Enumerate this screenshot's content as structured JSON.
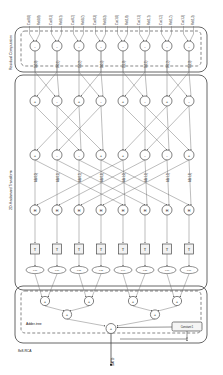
{
  "figure": {
    "bottom_block_label": "8x8-RCA",
    "output_label": "SATD"
  },
  "sections": {
    "residual": {
      "label": "Residual Computation"
    },
    "hadamard": {
      "label": "2D-Hadamard Transform"
    },
    "adder_tree": {
      "label": "Adder-tree"
    }
  },
  "constant": {
    "label": "Constant 1"
  },
  "top_inputs": [
    "Cur(0,0)",
    "Ref(0,0)",
    "Cur(0,1)",
    "Ref(0,1)",
    "Cur(0,2)",
    "Ref(0,2)",
    "Cur(0,3)",
    "Ref(0,3)",
    "Cur(1,0)",
    "Ref(1,0)",
    "Cur(1,1)",
    "Ref(1,1)",
    "Cur(1,2)",
    "Ref(1,2)",
    "Cur(1,3)",
    "Ref(1,3)"
  ],
  "residual_row": {
    "ops": [
      "-",
      "-",
      "-",
      "-",
      "-",
      "-",
      "-",
      "-"
    ],
    "outputs": [
      "D(0,0)",
      "D(0,1)",
      "D(0,2)",
      "D(0,3)",
      "D(1,0)",
      "D(1,1)",
      "D(1,2)",
      "D(1,3)"
    ]
  },
  "hadamard_stage1": {
    "ops": [
      "+",
      "-",
      "+",
      "-",
      "+",
      "-",
      "+",
      "-"
    ]
  },
  "hadamard_stage2": {
    "ops": [
      "+",
      "-",
      "-",
      "+",
      "+",
      "-",
      "-",
      "+"
    ],
    "outputs": [
      "AB(0,0)",
      "AB(0,1)",
      "AB(0,2)",
      "AB(0,3)",
      "AB(1,0)",
      "AB(1,1)",
      "AB(1,2)",
      "AB(1,3)"
    ]
  },
  "hadamard_stage3": {
    "ops": [
      "H",
      "H",
      "H",
      "H",
      "H",
      "H",
      "H",
      "H"
    ]
  },
  "abs_row": {
    "ops": [
      "T",
      "T",
      "T",
      "T",
      "T",
      "T",
      "T",
      "T"
    ],
    "labels": [
      "|H0|",
      "|H1|",
      "|H2|",
      "|H3|",
      "|H4|",
      "|H5|",
      "|H6|",
      "|H7|"
    ]
  },
  "adder_tree": {
    "level1_ops": [
      "+",
      "+",
      "+",
      "+"
    ],
    "level2_ops": [
      "+",
      "+"
    ],
    "level3_ops": [
      "+"
    ]
  },
  "colors": {
    "wire": "#6b6b6b",
    "node_stroke": "#4a4a4a",
    "panel": "#555555",
    "text": "#1a1a1a",
    "background": "#ffffff"
  }
}
